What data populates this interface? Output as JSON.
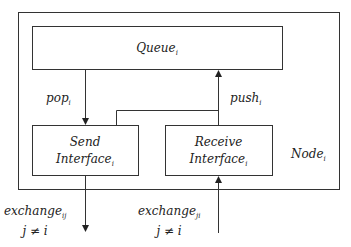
{
  "diagram": {
    "node": {
      "label": "Node",
      "sub": "i"
    },
    "queue": {
      "label": "Queue",
      "sub": "i"
    },
    "send_interface": {
      "line1": "Send",
      "line2": "Interface",
      "sub": "i"
    },
    "receive_interface": {
      "line1": "Receive",
      "line2": "Interface",
      "sub": "i"
    },
    "edges": {
      "pop": {
        "label": "pop",
        "sub": "i"
      },
      "push": {
        "label": "push",
        "sub": "i"
      },
      "exchange_out": {
        "label": "exchange",
        "sub": "ij",
        "condition": "j ≠ i"
      },
      "exchange_in": {
        "label": "exchange",
        "sub": "ji",
        "condition": "j ≠ i"
      }
    },
    "colors": {
      "stroke": "#333333",
      "text": "#222222",
      "background": "#ffffff"
    }
  }
}
